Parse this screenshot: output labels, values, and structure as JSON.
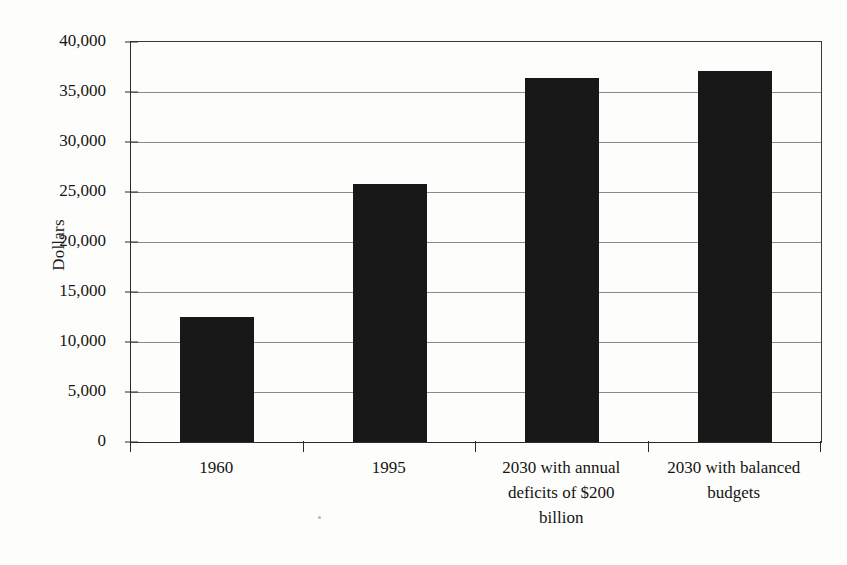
{
  "chart_data": {
    "type": "bar",
    "title": "",
    "subtitle": "",
    "xlabel": "",
    "ylabel": "Dollars",
    "categories": [
      "1960",
      "2030 with annual deficits of $200 billion",
      "1995",
      "2030 with balanced budgets"
    ],
    "bars": [
      {
        "label_lines": [
          "1960"
        ],
        "value": 12500
      },
      {
        "label_lines": [
          "1995"
        ],
        "value": 25800
      },
      {
        "label_lines": [
          "2030 with annual",
          "deficits of $200",
          "billion"
        ],
        "value": 36400
      },
      {
        "label_lines": [
          "2030 with balanced",
          "budgets"
        ],
        "value": 37100
      }
    ],
    "values": [
      12500,
      25800,
      36400,
      37100
    ],
    "ylim": [
      0,
      40000
    ],
    "ytick_step": 5000,
    "ytick_labels": [
      "40,000",
      "35,000",
      "30,000",
      "25,000",
      "20,000",
      "15,000",
      "10,000",
      "5,000",
      "0"
    ],
    "ytick_values": [
      40000,
      35000,
      30000,
      25000,
      20000,
      15000,
      10000,
      5000,
      0
    ],
    "grid": true,
    "grid_axis": "y",
    "legend": false,
    "legend_position": "none",
    "bar_color": "#181818",
    "grid_color": "#8a8a8a",
    "axis_color": "#2b2b2b",
    "background_color": "#fdfdfb"
  }
}
